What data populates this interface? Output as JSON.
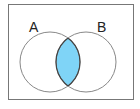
{
  "diagram": {
    "type": "venn",
    "sets": [
      {
        "label": "A",
        "cx": 50,
        "cy": 62,
        "r": 30
      },
      {
        "label": "B",
        "cx": 86,
        "cy": 62,
        "r": 30
      }
    ],
    "shaded_region": "A ∩ B",
    "colors": {
      "shade": "#7fd4f7",
      "outline": "#888888",
      "intersection_outline": "#444444",
      "frame": "#777777"
    }
  }
}
